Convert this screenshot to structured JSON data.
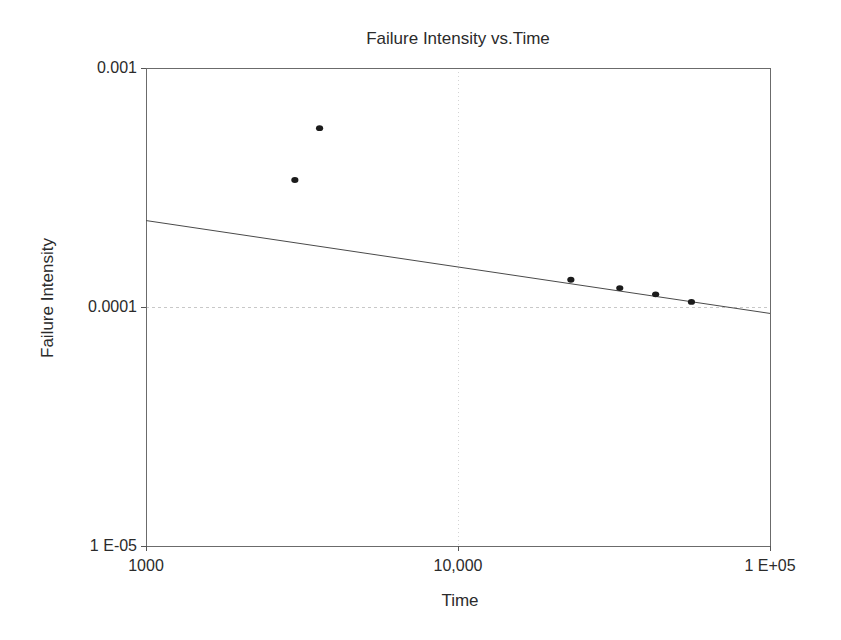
{
  "chart_data": {
    "type": "scatter",
    "title": "Failure Intensity vs.Time",
    "xlabel": "Time",
    "ylabel": "Failure Intensity",
    "x_scale": "log",
    "y_scale": "log",
    "xlim": [
      1000,
      100000
    ],
    "ylim": [
      1e-05,
      0.001
    ],
    "grid": "partial-dashed",
    "legend": "none",
    "x_ticks": [
      {
        "value": 1000,
        "label": "1000"
      },
      {
        "value": 10000,
        "label": "10,000"
      },
      {
        "value": 100000,
        "label": "1 E+05"
      }
    ],
    "y_ticks": [
      {
        "value": 0.001,
        "label": "0.001"
      },
      {
        "value": 0.0001,
        "label": "0.0001"
      },
      {
        "value": 1e-05,
        "label": "1 E-05"
      }
    ],
    "gridlines": {
      "x_values": [
        10000
      ],
      "y_values": [
        0.0001
      ]
    },
    "points": [
      {
        "x": 3000,
        "y": 0.00034
      },
      {
        "x": 3600,
        "y": 0.00056
      },
      {
        "x": 23000,
        "y": 0.00013
      },
      {
        "x": 33000,
        "y": 0.00012
      },
      {
        "x": 43000,
        "y": 0.000113
      },
      {
        "x": 56000,
        "y": 0.000105
      }
    ],
    "trendline": {
      "x1": 1000,
      "y1": 0.00023,
      "x2": 100000,
      "y2": 9.4e-05
    },
    "colors": {
      "background": "#ffffff",
      "text": "#2b2b2b",
      "axis_border": "#6b6b6b",
      "tick": "#555555",
      "gridline_h": "#c8c8c8",
      "gridline_v": "#d4d4d4",
      "trendline": "#4a4a4a",
      "point": "#1b1b1b"
    }
  }
}
